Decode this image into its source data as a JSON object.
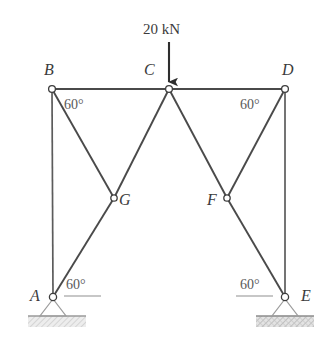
{
  "figure": {
    "type": "truss-diagram",
    "caption_text": "",
    "colors": {
      "member": "#4a4a4a",
      "column": "#5c5c5c",
      "top_chord": "#4a4a4a",
      "node_stroke": "#3d3d3d",
      "node_fill": "#ffffff",
      "label": "#3b3b3b",
      "angle_label": "#5a5a5a",
      "arrow": "#2e2e2e",
      "ground_fill": "#d9d9d9",
      "ground_line": "#8a8a8a",
      "background": "#ffffff"
    },
    "joints": [
      {
        "name": "A",
        "label": "A",
        "x": 53,
        "y": 297,
        "label_x": 30,
        "label_y": 288,
        "support": "pin"
      },
      {
        "name": "B",
        "label": "B",
        "x": 52,
        "y": 89,
        "label_x": 44,
        "label_y": 62,
        "support": "none"
      },
      {
        "name": "C",
        "label": "C",
        "x": 169,
        "y": 89,
        "label_x": 144,
        "label_y": 62,
        "support": "none"
      },
      {
        "name": "D",
        "label": "D",
        "x": 285,
        "y": 89,
        "label_x": 282,
        "label_y": 62,
        "support": "none"
      },
      {
        "name": "E",
        "label": "E",
        "x": 285,
        "y": 297,
        "label_x": 301,
        "label_y": 288,
        "support": "pin"
      },
      {
        "name": "F",
        "label": "F",
        "x": 227,
        "y": 198,
        "label_x": 207,
        "label_y": 192,
        "support": "none"
      },
      {
        "name": "G",
        "label": "G",
        "x": 114,
        "y": 198,
        "label_x": 119,
        "label_y": 192,
        "support": "none"
      }
    ],
    "members": [
      {
        "name": "AB",
        "from": "A",
        "to": "B",
        "kind": "column"
      },
      {
        "name": "BC",
        "from": "B",
        "to": "C",
        "kind": "top-chord"
      },
      {
        "name": "CD",
        "from": "C",
        "to": "D",
        "kind": "top-chord"
      },
      {
        "name": "DE",
        "from": "D",
        "to": "E",
        "kind": "column"
      },
      {
        "name": "BG",
        "from": "B",
        "to": "G",
        "kind": "diagonal"
      },
      {
        "name": "GC",
        "from": "G",
        "to": "C",
        "kind": "diagonal"
      },
      {
        "name": "AG",
        "from": "A",
        "to": "G",
        "kind": "diagonal"
      },
      {
        "name": "CF",
        "from": "C",
        "to": "F",
        "kind": "diagonal"
      },
      {
        "name": "FD",
        "from": "F",
        "to": "D",
        "kind": "diagonal"
      },
      {
        "name": "FE",
        "from": "F",
        "to": "E",
        "kind": "diagonal"
      }
    ],
    "angles": [
      {
        "name": "angle-at-B",
        "value": "60°",
        "x": 64,
        "y": 98,
        "at_joint": "B",
        "reference": "top-chord BC"
      },
      {
        "name": "angle-at-D",
        "value": "60°",
        "x": 240,
        "y": 98,
        "at_joint": "D",
        "reference": "top-chord CD"
      },
      {
        "name": "angle-at-A",
        "value": "60°",
        "x": 66,
        "y": 278,
        "at_joint": "A",
        "reference": "horizontal datum"
      },
      {
        "name": "angle-at-E",
        "value": "60°",
        "x": 240,
        "y": 278,
        "at_joint": "E",
        "reference": "horizontal datum"
      }
    ],
    "load": {
      "label": "20 kN",
      "label_x": 143,
      "label_y": 22,
      "applied_at": "C",
      "direction": "down",
      "arrow_x": 169,
      "arrow_top_y": 42,
      "arrow_tip_y": 87
    },
    "supports": [
      {
        "name": "support-A",
        "joint": "A",
        "type": "pin",
        "ground_x": 28,
        "ground_y": 316,
        "ground_w": 58,
        "pattern": "hatched"
      },
      {
        "name": "support-E",
        "joint": "E",
        "type": "pin",
        "ground_x": 256,
        "ground_y": 316,
        "ground_w": 58,
        "pattern": "hatched"
      }
    ]
  }
}
